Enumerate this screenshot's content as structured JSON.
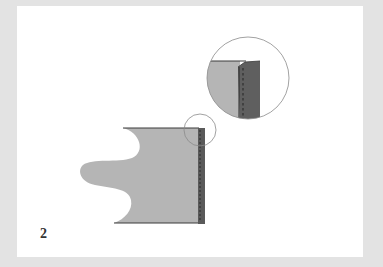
{
  "figure": {
    "step_number": "2",
    "colors": {
      "background_border": "#e3e3e3",
      "panel": "#ffffff",
      "fabric": "#b5b5b5",
      "fold_strip": "#5a5a5a",
      "outline": "#3a3a3a",
      "stitch": "#2a2a2a",
      "magnifier_ring": "#8a8a8a"
    }
  }
}
